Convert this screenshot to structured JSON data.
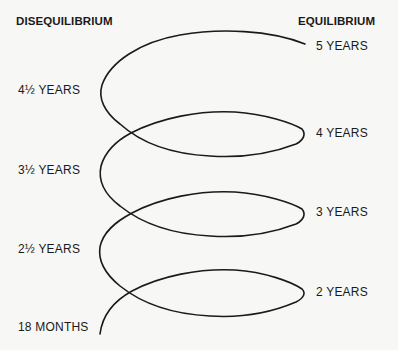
{
  "headings": {
    "left": "DISEQUILIBRIUM",
    "right": "EQUILIBRIUM"
  },
  "disequilibrium_labels": [
    {
      "text": "4½ YEARS"
    },
    {
      "text": "3½ YEARS"
    },
    {
      "text": "2½ YEARS"
    },
    {
      "text": "18 MONTHS"
    }
  ],
  "equilibrium_labels": [
    {
      "text": "5 YEARS"
    },
    {
      "text": "4 YEARS"
    },
    {
      "text": "3 YEARS"
    },
    {
      "text": "2 YEARS"
    }
  ],
  "colors": {
    "background": "#f7f7f6",
    "line": "#1a1a1a",
    "text": "#1a1a1a"
  }
}
